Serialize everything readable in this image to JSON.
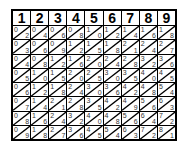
{
  "header": [
    "1",
    "2",
    "3",
    "4",
    "5",
    "6",
    "7",
    "8",
    "9"
  ],
  "rows": [
    {
      "multiplier": 2,
      "cells": [
        [
          "0",
          "2"
        ],
        [
          "0",
          "4"
        ],
        [
          "0",
          "6"
        ],
        [
          "0",
          "8"
        ],
        [
          "1",
          "0"
        ],
        [
          "1",
          "2"
        ],
        [
          "1",
          "4"
        ],
        [
          "1",
          "6"
        ],
        [
          "1",
          "8"
        ]
      ]
    },
    {
      "multiplier": 3,
      "cells": [
        [
          "0",
          "3"
        ],
        [
          "0",
          "6"
        ],
        [
          "0",
          "9"
        ],
        [
          "1",
          "2"
        ],
        [
          "1",
          "5"
        ],
        [
          "1",
          "8"
        ],
        [
          "2",
          "1"
        ],
        [
          "2",
          "4"
        ],
        [
          "2",
          "7"
        ]
      ]
    },
    {
      "multiplier": 4,
      "cells": [
        [
          "0",
          "4"
        ],
        [
          "0",
          "8"
        ],
        [
          "1",
          "2"
        ],
        [
          "1",
          "6"
        ],
        [
          "2",
          "0"
        ],
        [
          "2",
          "4"
        ],
        [
          "2",
          "8"
        ],
        [
          "3",
          "2"
        ],
        [
          "3",
          "6"
        ]
      ]
    },
    {
      "multiplier": 5,
      "cells": [
        [
          "0",
          "5"
        ],
        [
          "1",
          "0"
        ],
        [
          "1",
          "5"
        ],
        [
          "2",
          "0"
        ],
        [
          "2",
          "5"
        ],
        [
          "3",
          "0"
        ],
        [
          "3",
          "5"
        ],
        [
          "4",
          "0"
        ],
        [
          "4",
          "5"
        ]
      ]
    },
    {
      "multiplier": 6,
      "cells": [
        [
          "0",
          "6"
        ],
        [
          "1",
          "2"
        ],
        [
          "1",
          "8"
        ],
        [
          "2",
          "4"
        ],
        [
          "3",
          "0"
        ],
        [
          "3",
          "6"
        ],
        [
          "4",
          "2"
        ],
        [
          "4",
          "8"
        ],
        [
          "5",
          "4"
        ]
      ]
    },
    {
      "multiplier": 7,
      "cells": [
        [
          "0",
          "7"
        ],
        [
          "1",
          "4"
        ],
        [
          "2",
          "1"
        ],
        [
          "2",
          "8"
        ],
        [
          "3",
          "5"
        ],
        [
          "4",
          "2"
        ],
        [
          "4",
          "9"
        ],
        [
          "5",
          "6"
        ],
        [
          "6",
          "3"
        ]
      ]
    },
    {
      "multiplier": 8,
      "cells": [
        [
          "0",
          "8"
        ],
        [
          "1",
          "6"
        ],
        [
          "2",
          "4"
        ],
        [
          "3",
          "2"
        ],
        [
          "4",
          "0"
        ],
        [
          "4",
          "8"
        ],
        [
          "5",
          "6"
        ],
        [
          "6",
          "4"
        ],
        [
          "7",
          "2"
        ]
      ]
    },
    {
      "multiplier": 9,
      "cells": [
        [
          "0",
          "9"
        ],
        [
          "1",
          "8"
        ],
        [
          "2",
          "7"
        ],
        [
          "3",
          "6"
        ],
        [
          "4",
          "5"
        ],
        [
          "5",
          "4"
        ],
        [
          "6",
          "3"
        ],
        [
          "7",
          "2"
        ],
        [
          "8",
          "1"
        ]
      ]
    }
  ],
  "colors": {
    "line": "#000000",
    "background": "#ffffff",
    "digit": "#333333"
  }
}
